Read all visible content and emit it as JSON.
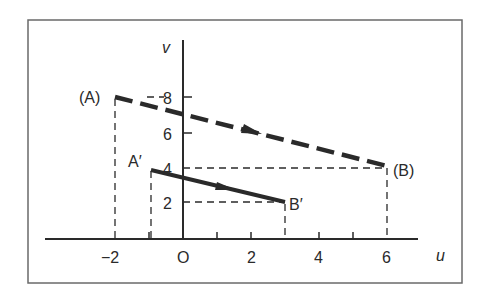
{
  "diagram": {
    "axes": {
      "x_label": "u",
      "y_label": "v",
      "origin_label": "O",
      "x_tick_labels": [
        "-2",
        "O",
        "2",
        "4",
        "6"
      ],
      "y_tick_labels": [
        "2",
        "4",
        "6",
        "8"
      ]
    },
    "points": {
      "A": {
        "label": "(A)",
        "u": -2,
        "v": 8
      },
      "B": {
        "label": "(B)",
        "u": 6,
        "v": 4
      },
      "A_prime": {
        "label": "A′",
        "u": -1,
        "v": 4
      },
      "B_prime": {
        "label": "B′",
        "u": 3,
        "v": 2
      }
    },
    "segments": [
      {
        "from": "A",
        "to": "B",
        "style": "dashed-thick",
        "arrow": "midpoint"
      },
      {
        "from": "A_prime",
        "to": "B_prime",
        "style": "solid-thick",
        "arrow": "midpoint"
      }
    ],
    "labels": {
      "A": "(A)",
      "B": "(B)",
      "A_prime": "A′",
      "B_prime": "B′",
      "u": "u",
      "v": "v",
      "x_m2": "−2",
      "x_0": "O",
      "x_2": "2",
      "x_4": "4",
      "x_6": "6",
      "y_2": "2",
      "y_4": "4",
      "y_6": "6",
      "y_8": "8"
    },
    "colors": {
      "line": "#2a2a2a",
      "frame": "#6a6a6a",
      "background": "#ffffff"
    }
  }
}
